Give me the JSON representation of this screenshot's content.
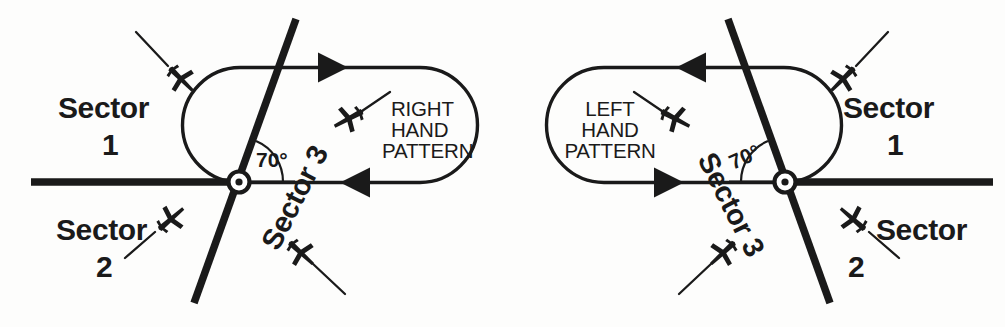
{
  "figure": {
    "ink_color": "#1a1a1a",
    "background_color": "#fdfdfc"
  },
  "diagrams": [
    {
      "id": "right-hand",
      "pattern_label_lines": [
        "RIGHT",
        "HAND",
        "PATTERN"
      ],
      "angle_label": "70°",
      "sector1_label": "Sector",
      "sector1_number": "1",
      "sector2_label": "Sector",
      "sector2_number": "2",
      "sector3_label": "Sector 3",
      "turn_direction": "right",
      "outbound_arrow": "right",
      "inbound_arrow": "left",
      "fix": {
        "x": 239,
        "y": 182
      },
      "aircraft_count": 4
    },
    {
      "id": "left-hand",
      "pattern_label_lines": [
        "LEFT",
        "HAND",
        "PATTERN"
      ],
      "angle_label": "70°",
      "sector1_label": "Sector",
      "sector1_number": "1",
      "sector2_label": "Sector",
      "sector2_number": "2",
      "sector3_label": "Sector 3",
      "turn_direction": "left",
      "outbound_arrow": "left",
      "inbound_arrow": "right",
      "fix": {
        "x": 785,
        "y": 182
      },
      "aircraft_count": 4
    }
  ]
}
